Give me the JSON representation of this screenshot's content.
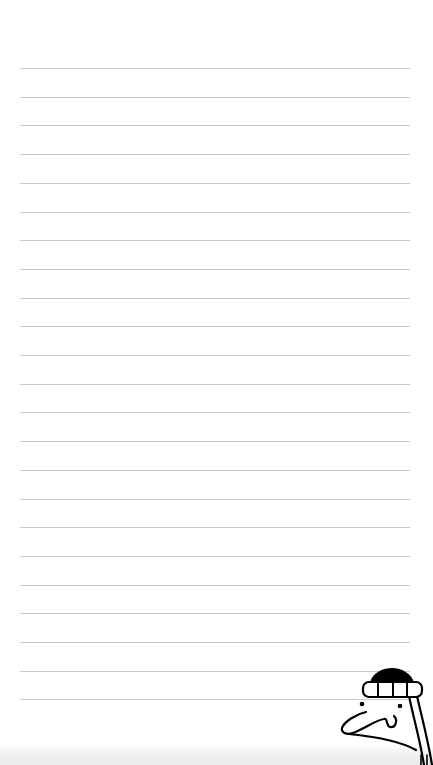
{
  "paper": {
    "background": "#ffffff",
    "rule_color": "#c9c9c9",
    "rule_left": 20,
    "rule_width": 390,
    "rule_first_y": 68,
    "rule_spacing": 28.7,
    "rule_count": 23
  },
  "decoration": {
    "icon": "cartoon-man-with-beanie-icon",
    "position": "bottom-right"
  }
}
